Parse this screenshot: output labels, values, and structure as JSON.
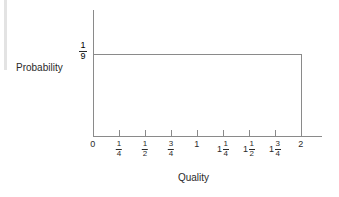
{
  "chart_data": {
    "type": "line",
    "title": "",
    "xlabel": "Quality",
    "ylabel": "Probability",
    "xlim": [
      0,
      2
    ],
    "ylim": [
      0,
      0.15
    ],
    "grid": false,
    "legend": null,
    "x_tick_values": [
      0,
      0.25,
      0.5,
      0.75,
      1,
      1.25,
      1.5,
      1.75,
      2
    ],
    "x_tick_labels": [
      {
        "whole": "0",
        "num": "",
        "den": ""
      },
      {
        "whole": "",
        "num": "1",
        "den": "4"
      },
      {
        "whole": "",
        "num": "1",
        "den": "2"
      },
      {
        "whole": "",
        "num": "3",
        "den": "4"
      },
      {
        "whole": "1",
        "num": "",
        "den": ""
      },
      {
        "whole": "1",
        "num": "1",
        "den": "4"
      },
      {
        "whole": "1",
        "num": "1",
        "den": "2"
      },
      {
        "whole": "1",
        "num": "3",
        "den": "4"
      },
      {
        "whole": "2",
        "num": "",
        "den": ""
      }
    ],
    "y_tick_values": [
      0.1111
    ],
    "y_tick_labels": [
      {
        "whole": "",
        "num": "1",
        "den": "9"
      }
    ],
    "series": [
      {
        "name": "Probability density",
        "x": [
          0,
          2
        ],
        "values": [
          0.1111,
          0.1111
        ],
        "value_label": "1/9"
      }
    ],
    "line_color": "#8a8a8a",
    "axis_color": "#8a8a8a",
    "text_color": "#2a2a2a",
    "background_color": "#ffffff"
  }
}
